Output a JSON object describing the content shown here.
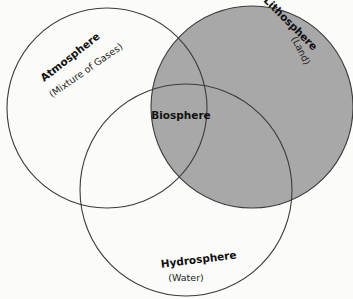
{
  "diagram": {
    "type": "venn",
    "title": "",
    "colors": {
      "background": "#fbfbf9",
      "lithosphere_fill": "#a8a8a8",
      "stroke": "#3c3c3c"
    },
    "circles": [
      {
        "id": "atmosphere",
        "label": "Atmosphere",
        "sublabel": "(Mixture of Gases)",
        "cx": 107,
        "cy": 108,
        "r": 100,
        "filled": false
      },
      {
        "id": "lithosphere",
        "label": "Lithosphere",
        "sublabel": "(Land)",
        "cx": 252,
        "cy": 107,
        "r": 101,
        "filled": true
      },
      {
        "id": "hydrosphere",
        "label": "Hydrosphere",
        "sublabel": "(Water)",
        "cx": 186,
        "cy": 190,
        "r": 106,
        "filled": false
      }
    ],
    "center_label": "Biosphere"
  }
}
